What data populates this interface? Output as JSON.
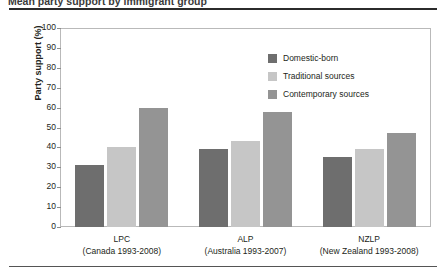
{
  "figure": {
    "title": "Mean party support by immigrant group",
    "top_rule": true,
    "bottom_rule": true
  },
  "chart_data": {
    "type": "bar",
    "title": "Mean party support by immigrant group",
    "xlabel": "",
    "ylabel": "Party support (%)",
    "ylim": [
      0,
      100
    ],
    "ytick_step": 10,
    "yticks": [
      100,
      90,
      80,
      70,
      60,
      50,
      40,
      30,
      20,
      10,
      0
    ],
    "grid": false,
    "legend_position": "inside-top-right",
    "categories": [
      "LPC",
      "ALP",
      "NZLP"
    ],
    "category_sublabels": [
      "(Canada 1993-2008)",
      "(Australia 1993-2007)",
      "(New Zealand 1993-2008)"
    ],
    "series": [
      {
        "name": "Domestic-born",
        "color": "#6e6e6e",
        "values": [
          31,
          39,
          35
        ]
      },
      {
        "name": "Traditional sources",
        "color": "#c6c6c6",
        "values": [
          40,
          43,
          39
        ]
      },
      {
        "name": "Contemporary sources",
        "color": "#949494",
        "values": [
          60,
          58,
          47
        ]
      }
    ]
  },
  "axis": {
    "y_title": "Party support (%)"
  }
}
